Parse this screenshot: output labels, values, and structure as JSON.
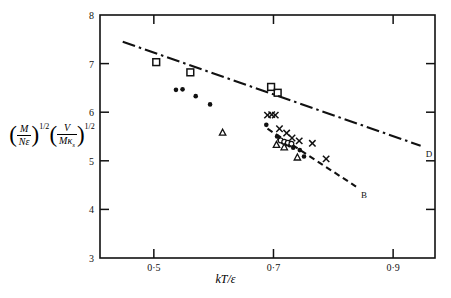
{
  "figure": {
    "ylabel": {
      "num1": "M",
      "den1": "Nε",
      "exp1": "1/2",
      "num2": "V",
      "den2_main": "Mκ",
      "den2_sub": "s",
      "exp2": "1/2"
    },
    "xlabel": "kT/ε",
    "line_label_d": "D",
    "line_label_b": "B"
  },
  "chart_data": {
    "type": "scatter",
    "title": "",
    "xlabel": "kT/ε",
    "ylabel": "(M/Nε)^(1/2) (V/Mκ_s)^(1/2)",
    "xlim": [
      0.41,
      0.97
    ],
    "ylim": [
      3,
      8
    ],
    "xticks": [
      0.5,
      0.7,
      0.9
    ],
    "xticklabels": [
      "0·5",
      "0·7",
      "0·9"
    ],
    "yticks": [
      3,
      4,
      5,
      6,
      7,
      8
    ],
    "yticklabels": [
      "3",
      "4",
      "5",
      "6",
      "7",
      "8"
    ],
    "grid": false,
    "legend": "none",
    "series": [
      {
        "name": "open-squares",
        "marker": "open-square",
        "x": [
          0.504,
          0.561,
          0.696,
          0.707
        ],
        "y": [
          7.03,
          6.82,
          6.52,
          6.4
        ]
      },
      {
        "name": "filled-circles",
        "marker": "filled-circle",
        "x": [
          0.537,
          0.548,
          0.57,
          0.594,
          0.688,
          0.706,
          0.71,
          0.716,
          0.722,
          0.727,
          0.733,
          0.744,
          0.751
        ],
        "y": [
          6.46,
          6.47,
          6.33,
          6.16,
          5.74,
          5.5,
          5.44,
          5.38,
          5.34,
          5.32,
          5.27,
          5.22,
          5.09
        ]
      },
      {
        "name": "open-circles",
        "marker": "open-circle",
        "x": [
          0.712,
          0.718,
          0.724,
          0.73
        ],
        "y": [
          5.42,
          5.39,
          5.37,
          5.35
        ]
      },
      {
        "name": "open-triangles",
        "marker": "open-triangle",
        "x": [
          0.615,
          0.705,
          0.718,
          0.74
        ],
        "y": [
          5.58,
          5.33,
          5.28,
          5.07
        ]
      },
      {
        "name": "crosses",
        "marker": "cross",
        "x": [
          0.69,
          0.697,
          0.703,
          0.71,
          0.722,
          0.731,
          0.743,
          0.765
        ],
        "y": [
          5.94,
          5.95,
          5.94,
          5.66,
          5.57,
          5.47,
          5.41,
          5.36
        ]
      },
      {
        "name": "cross-lower",
        "marker": "cross",
        "x": [
          0.788
        ],
        "y": [
          5.04
        ]
      }
    ],
    "lines": [
      {
        "name": "line-D",
        "label": "D",
        "style": "dash-dot",
        "x": [
          0.448,
          0.946
        ],
        "y": [
          7.45,
          5.31
        ]
      },
      {
        "name": "line-B",
        "label": "B",
        "style": "dashed",
        "x": [
          0.69,
          0.838
        ],
        "y": [
          5.66,
          4.47
        ]
      }
    ]
  }
}
